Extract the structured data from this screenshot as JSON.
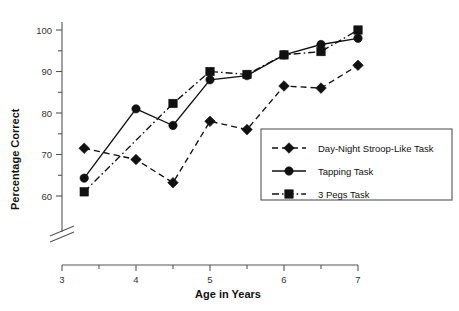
{
  "chart_data": {
    "type": "line",
    "title": "",
    "xlabel": "Age in Years",
    "ylabel": "Percentage Correct",
    "xlim": [
      3,
      7
    ],
    "ylim": [
      58,
      103
    ],
    "grid": false,
    "legend_position": "inside-lower-right",
    "axis_break_x": true,
    "axis_break_y": true,
    "x_ticks_major": [
      3,
      4,
      5,
      6,
      7
    ],
    "x_ticks_minor": [
      3.5,
      4.5,
      5.5,
      6.5
    ],
    "x_tick_labels": [
      "3",
      "4",
      "5",
      "6",
      "7"
    ],
    "y_ticks_major": [
      60,
      70,
      80,
      90,
      100
    ],
    "y_ticks_minor": [
      65,
      75,
      85,
      95
    ],
    "y_tick_labels": [
      "60",
      "70",
      "80",
      "90",
      "100"
    ],
    "series": [
      {
        "name": "Day-Night Stroop-Like Task",
        "marker": "diamond",
        "dash": "dashed",
        "x": [
          3.3,
          4,
          4.5,
          5,
          5.5,
          6,
          6.5,
          7
        ],
        "values": [
          71.5,
          68.8,
          63.2,
          78,
          76,
          86.5,
          86,
          91.5
        ]
      },
      {
        "name": "Tapping Task",
        "marker": "circle",
        "dash": "solid",
        "x": [
          3.3,
          4,
          4.5,
          5,
          5.5,
          6,
          6.5,
          7
        ],
        "values": [
          64.3,
          81,
          77,
          88,
          89,
          94,
          96.5,
          98
        ]
      },
      {
        "name": "3 Pegs Task",
        "marker": "square",
        "dash": "dash-dot",
        "x": [
          3.3,
          4.5,
          5,
          5.5,
          6,
          6.5,
          7
        ],
        "values": [
          61,
          82.3,
          90,
          89.3,
          94,
          94.8,
          100
        ]
      }
    ]
  },
  "legend": {
    "entries": [
      "Day-Night Stroop-Like Task",
      "Tapping Task",
      "3 Pegs Task"
    ]
  },
  "colors": {
    "ink": "#111111",
    "axis": "#555555",
    "background": "#ffffff"
  }
}
